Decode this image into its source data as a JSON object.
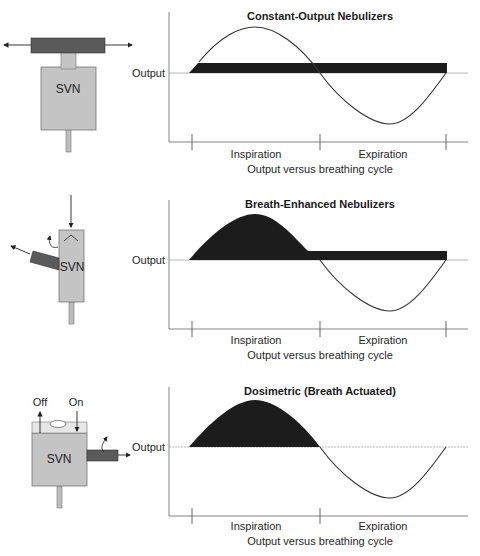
{
  "panels": [
    {
      "device": {
        "label": "SVN",
        "type": "constant-output"
      },
      "chart": {
        "title": "Constant-Output Nebulizers",
        "ylabel": "Output",
        "phase_labels": [
          "Inspiration",
          "Expiration"
        ],
        "caption": "Output versus breathing cycle"
      }
    },
    {
      "device": {
        "label": "SVN",
        "type": "breath-enhanced"
      },
      "chart": {
        "title": "Breath-Enhanced Nebulizers",
        "ylabel": "Output",
        "phase_labels": [
          "Inspiration",
          "Expiration"
        ],
        "caption": "Output versus breathing cycle"
      }
    },
    {
      "device": {
        "label": "SVN",
        "type": "dosimetric",
        "valve_labels": [
          "Off",
          "On"
        ]
      },
      "chart": {
        "title": "Dosimetric (Breath Actuated)",
        "ylabel": "Output",
        "phase_labels": [
          "Inspiration",
          "Expiration"
        ],
        "caption": "Output versus breathing cycle"
      }
    }
  ],
  "colors": {
    "device_body": "#c4c4c4",
    "device_dark": "#5a5a5a",
    "fill": "#1c1c1c",
    "line": "#333333",
    "axis": "#666666"
  }
}
